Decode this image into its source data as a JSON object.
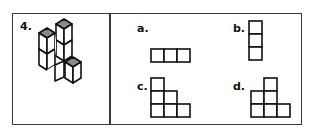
{
  "question": {
    "number_label": "4.",
    "figure": "isometric-cube-stack",
    "top_color": "#8a8a8a"
  },
  "options": [
    {
      "label": "a.",
      "shape": "row-of-3-squares"
    },
    {
      "label": "b.",
      "shape": "column-of-3-squares"
    },
    {
      "label": "c.",
      "shape": "staircase-3-2-1-left-aligned"
    },
    {
      "label": "d.",
      "shape": "middle-tower-3-with-base-3"
    }
  ]
}
